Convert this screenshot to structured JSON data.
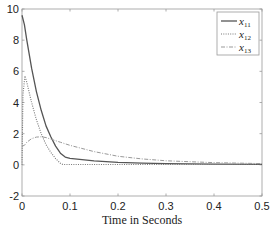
{
  "chart_data": {
    "type": "line",
    "title": "",
    "xlabel": "Time in Seconds",
    "ylabel": "",
    "xlim": [
      0,
      0.5
    ],
    "ylim": [
      -2,
      10
    ],
    "xticks": [
      0,
      0.1,
      0.2,
      0.3,
      0.4,
      0.5
    ],
    "xtick_labels": [
      "0",
      "0.1",
      "0.2",
      "0.3",
      "0.4",
      "0.5"
    ],
    "yticks": [
      -2,
      0,
      2,
      4,
      6,
      8,
      10
    ],
    "ytick_labels": [
      "-2",
      "0",
      "2",
      "4",
      "6",
      "8",
      "10"
    ],
    "grid": false,
    "legend_position": "top-right",
    "series": [
      {
        "name": "x11",
        "label_main": "x",
        "label_sub": "11",
        "style": "solid",
        "color": "#555555",
        "x": [
          0,
          0.005,
          0.01,
          0.02,
          0.03,
          0.04,
          0.05,
          0.06,
          0.07,
          0.08,
          0.09,
          0.1,
          0.15,
          0.2,
          0.25,
          0.3,
          0.4,
          0.5
        ],
        "y": [
          9.6,
          9.0,
          8.0,
          6.2,
          4.7,
          3.5,
          2.5,
          1.8,
          1.2,
          0.75,
          0.5,
          0.42,
          0.25,
          0.16,
          0.11,
          0.08,
          0.05,
          0.03
        ]
      },
      {
        "name": "x12",
        "label_main": "x",
        "label_sub": "12",
        "style": "dotted",
        "color": "#777777",
        "x": [
          0,
          0.002,
          0.006,
          0.01,
          0.02,
          0.03,
          0.04,
          0.05,
          0.06,
          0.07,
          0.08,
          0.085,
          0.1,
          0.2,
          0.3,
          0.4,
          0.5
        ],
        "y": [
          0,
          4.5,
          5.7,
          5.3,
          4.0,
          2.9,
          2.0,
          1.3,
          0.8,
          0.4,
          0.1,
          0.02,
          0.02,
          0.02,
          0.02,
          0.02,
          0.02
        ]
      },
      {
        "name": "x13",
        "label_main": "x",
        "label_sub": "13",
        "style": "dashdot",
        "color": "#999999",
        "x": [
          0,
          0.005,
          0.01,
          0.02,
          0.03,
          0.04,
          0.05,
          0.06,
          0.08,
          0.1,
          0.15,
          0.2,
          0.25,
          0.3,
          0.4,
          0.5
        ],
        "y": [
          1.2,
          1.25,
          1.45,
          1.68,
          1.78,
          1.8,
          1.75,
          1.65,
          1.45,
          1.25,
          0.85,
          0.55,
          0.38,
          0.26,
          0.14,
          0.08
        ]
      }
    ]
  }
}
